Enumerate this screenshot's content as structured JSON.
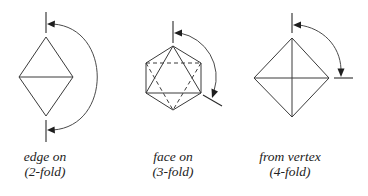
{
  "figure": {
    "colors": {
      "line": "#3a3a3a",
      "arrow": "#1e1e1e",
      "text": "#222222",
      "background": "#ffffff"
    },
    "diagrams": [
      {
        "id": "edge-on",
        "view_label": "edge on",
        "fold_label": "(2-fold)",
        "shape": "rhombus with horizontal diagonal",
        "rotation_arrow": "arc from top axis to bottom axis (180°)"
      },
      {
        "id": "face-on",
        "view_label": "face on",
        "fold_label": "(3-fold)",
        "shape": "hexagon outline with solid front triangle and dashed back triangle",
        "rotation_arrow": "arc from top axis to lower-right edge (120°)"
      },
      {
        "id": "from-vertex",
        "view_label": "from vertex",
        "fold_label": "(4-fold)",
        "shape": "square on point with both diagonals",
        "rotation_arrow": "arc from top axis to right horizontal (90°)"
      }
    ]
  }
}
